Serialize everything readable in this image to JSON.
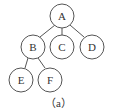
{
  "diagram": {
    "type": "tree",
    "nodes": [
      {
        "id": "A",
        "label": "A",
        "x": 62,
        "y": 16
      },
      {
        "id": "B",
        "label": "B",
        "x": 33,
        "y": 47
      },
      {
        "id": "C",
        "label": "C",
        "x": 62,
        "y": 47
      },
      {
        "id": "D",
        "label": "D",
        "x": 92,
        "y": 47
      },
      {
        "id": "E",
        "label": "E",
        "x": 21,
        "y": 80
      },
      {
        "id": "F",
        "label": "F",
        "x": 50,
        "y": 80
      }
    ],
    "edges": [
      [
        "A",
        "B"
      ],
      [
        "A",
        "C"
      ],
      [
        "A",
        "D"
      ],
      [
        "B",
        "E"
      ],
      [
        "B",
        "F"
      ]
    ],
    "caption": "（a）"
  }
}
